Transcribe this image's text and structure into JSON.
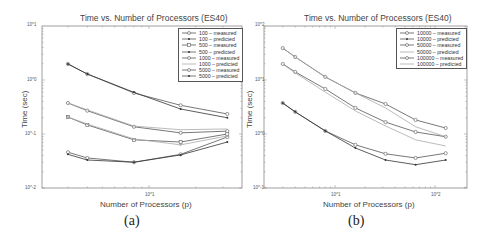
{
  "figure": {
    "panels": [
      {
        "caption": "(a)",
        "title": "Time vs. Number of Processors (ES40)",
        "xlabel": "Number of Processors (p)",
        "ylabel": "Time (sec)",
        "yticks": [
          "10^1",
          "10^0",
          "10^-1",
          "10^-2"
        ],
        "xticks": [
          "10^1"
        ],
        "legend": [
          "100 – measured",
          "100 – predicted",
          "500 – measured",
          "500 – predicted",
          "1000 – measured",
          "1000 – predicted",
          "5000 – measured",
          "5000 – predicted"
        ]
      },
      {
        "caption": "(b)",
        "title": "Time vs. Number of Processors (ES40)",
        "xlabel": "Number of Processors (p)",
        "ylabel": "Time (sec)",
        "yticks": [
          "10^2",
          "10^1",
          "10^0",
          "10^-1"
        ],
        "xticks": [
          "10^1",
          "10^2"
        ],
        "legend": [
          "10000 – measured",
          "10000 – predicted",
          "50000 – measured",
          "50000 – predicted",
          "100000 – measured",
          "100000 – predicted"
        ]
      }
    ]
  },
  "chart_data": [
    {
      "type": "line",
      "title": "Time vs. Number of Processors (ES40)",
      "xlabel": "Number of Processors (p)",
      "ylabel": "Time (sec)",
      "xscale": "log",
      "yscale": "log",
      "xlim": [
        2,
        40
      ],
      "ylim": [
        0.01,
        10
      ],
      "grid": false,
      "legend_position": "upper right",
      "x": [
        3,
        4,
        8,
        16,
        32
      ],
      "series": [
        {
          "name": "100 – measured",
          "values": [
            0.046,
            0.036,
            0.03,
            0.042,
            0.088
          ],
          "style": "solid-circle"
        },
        {
          "name": "100 – predicted",
          "values": [
            0.042,
            0.033,
            0.03,
            0.041,
            0.071
          ],
          "style": "solid-dot"
        },
        {
          "name": "500 – measured",
          "values": [
            0.206,
            0.147,
            0.078,
            0.071,
            0.1
          ],
          "style": "solid-square"
        },
        {
          "name": "500 – predicted",
          "values": [
            0.206,
            0.153,
            0.081,
            0.063,
            0.092
          ],
          "style": "light-dot"
        },
        {
          "name": "1000 – measured",
          "values": [
            0.375,
            0.27,
            0.136,
            0.105,
            0.113
          ],
          "style": "solid-circle"
        },
        {
          "name": "1000 – predicted",
          "values": [
            0.375,
            0.28,
            0.14,
            0.12,
            0.124
          ],
          "style": "light"
        },
        {
          "name": "5000 – measured",
          "values": [
            1.98,
            1.29,
            0.575,
            0.34,
            0.235
          ],
          "style": "solid-circle"
        },
        {
          "name": "5000 – predicted",
          "values": [
            1.98,
            1.29,
            0.59,
            0.29,
            0.2
          ],
          "style": "solid-dot"
        }
      ]
    },
    {
      "type": "line",
      "title": "Time vs. Number of Processors (ES40)",
      "xlabel": "Number of Processors (p)",
      "ylabel": "Time (sec)",
      "xscale": "log",
      "yscale": "log",
      "xlim": [
        2,
        200
      ],
      "ylim": [
        0.1,
        100
      ],
      "grid": false,
      "legend_position": "upper right",
      "x": [
        3,
        4,
        8,
        16,
        32,
        64,
        128
      ],
      "series": [
        {
          "name": "10000 – measured",
          "values": [
            3.75,
            2.57,
            1.14,
            0.63,
            0.43,
            0.36,
            0.44
          ],
          "style": "solid-circle"
        },
        {
          "name": "10000 – predicted",
          "values": [
            3.75,
            2.57,
            1.14,
            0.55,
            0.33,
            0.27,
            0.33
          ],
          "style": "solid-dot"
        },
        {
          "name": "50000 – measured",
          "values": [
            19.8,
            14.1,
            6.83,
            3.04,
            1.66,
            1.09,
            0.89
          ],
          "style": "solid-circle"
        },
        {
          "name": "50000 – predicted",
          "values": [
            19.8,
            13.5,
            5.97,
            2.67,
            1.41,
            0.78,
            0.6
          ],
          "style": "light"
        },
        {
          "name": "100000 – measured",
          "values": [
            39.0,
            26.7,
            11.4,
            5.76,
            3.6,
            1.82,
            1.29
          ],
          "style": "solid-circle"
        },
        {
          "name": "100000 – predicted",
          "values": [
            39.0,
            26.7,
            11.4,
            5.76,
            3.04,
            1.36,
            0.89
          ],
          "style": "light"
        }
      ]
    }
  ]
}
